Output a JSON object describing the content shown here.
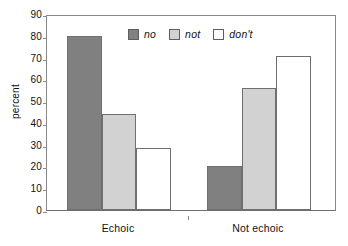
{
  "chart_data": {
    "type": "bar",
    "title": "",
    "subtitle": "",
    "xlabel": "",
    "ylabel": "percent",
    "categories": [
      "Echoic",
      "Not echoic"
    ],
    "series": [
      {
        "name": "no",
        "values": [
          80,
          20
        ],
        "color": "#808080"
      },
      {
        "name": "not",
        "values": [
          44,
          56
        ],
        "color": "#d2d2d2"
      },
      {
        "name": "don't",
        "values": [
          28.5,
          70.5
        ],
        "color": "#ffffff"
      }
    ],
    "ylim": [
      0,
      90
    ],
    "yticks": [
      0,
      10,
      20,
      30,
      40,
      50,
      60,
      70,
      80,
      90
    ],
    "ytick_labels": [
      "0",
      "10",
      "20",
      "30",
      "40",
      "50",
      "60",
      "70",
      "80",
      "90"
    ],
    "grid": false,
    "legend_position": "top-center",
    "legend_entries": [
      "no",
      "not",
      "don't"
    ],
    "legend_italic": true,
    "frame": "box",
    "bar_edge_color": "#6f6f6f",
    "axis_color": "#8a8a8a",
    "background": "#ffffff"
  }
}
